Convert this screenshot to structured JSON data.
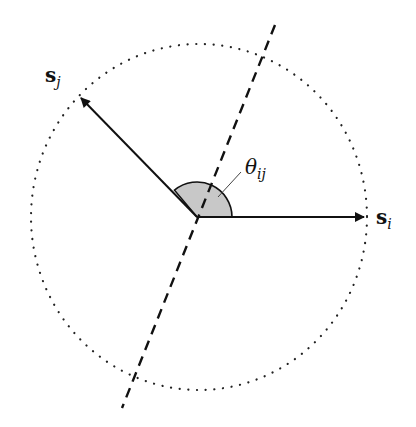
{
  "diagram": {
    "vectors": [
      {
        "id": "s_i",
        "label_main": "s",
        "label_sub": "i"
      },
      {
        "id": "s_j",
        "label_main": "s",
        "label_sub": "j"
      }
    ],
    "angle": {
      "label_main": "θ",
      "label_sub": "ij"
    },
    "colors": {
      "stroke": "#111111",
      "angle_fill": "#c8c8c8",
      "background": "#ffffff"
    }
  }
}
